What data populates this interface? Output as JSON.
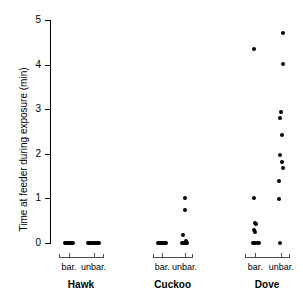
{
  "chart_data": {
    "type": "scatter",
    "title": "",
    "xlabel": "",
    "ylabel": "Time at feeder during exposure (min)",
    "ylim": [
      0,
      5
    ],
    "yticks": [
      0,
      1,
      2,
      3,
      4,
      5
    ],
    "ytick_labels": [
      "0",
      "1",
      "2",
      "3",
      "4",
      "5"
    ],
    "grid": false,
    "legend": "none",
    "groups": [
      "Hawk",
      "Cuckoo",
      "Dove"
    ],
    "subcategories": [
      "bar.",
      "unbar."
    ],
    "series": [
      {
        "name": "Hawk bar.",
        "group": "Hawk",
        "subcategory": "bar.",
        "values": [
          0,
          0,
          0,
          0,
          0,
          0,
          0,
          0,
          0,
          0,
          0,
          0
        ]
      },
      {
        "name": "Hawk unbar.",
        "group": "Hawk",
        "subcategory": "unbar.",
        "values": [
          0,
          0,
          0,
          0,
          0,
          0,
          0,
          0,
          0,
          0,
          0,
          0,
          0,
          0
        ]
      },
      {
        "name": "Cuckoo bar.",
        "group": "Cuckoo",
        "subcategory": "bar.",
        "values": [
          0,
          0,
          0,
          0,
          0,
          0,
          0,
          0,
          0,
          0,
          0,
          0
        ]
      },
      {
        "name": "Cuckoo unbar.",
        "group": "Cuckoo",
        "subcategory": "unbar.",
        "values": [
          1.0,
          0.74,
          0.18,
          0.05,
          0,
          0,
          0,
          0,
          0,
          0,
          0,
          0
        ]
      },
      {
        "name": "Dove bar.",
        "group": "Dove",
        "subcategory": "bar.",
        "values": [
          4.35,
          1.0,
          0.45,
          0.4,
          0.3,
          0.25,
          0.2,
          0,
          0,
          0,
          0,
          0
        ]
      },
      {
        "name": "Dove unbar.",
        "group": "Dove",
        "subcategory": "unbar.",
        "values": [
          4.7,
          4.01,
          2.94,
          2.8,
          2.42,
          1.97,
          1.82,
          1.68,
          1.4,
          0.98,
          0
        ]
      }
    ],
    "points": [
      {
        "x": 0.52,
        "y": 0
      },
      {
        "x": 0.56,
        "y": 0
      },
      {
        "x": 0.6,
        "y": 0
      },
      {
        "x": 0.64,
        "y": 0
      },
      {
        "x": 0.68,
        "y": 0
      },
      {
        "x": 0.72,
        "y": 0
      },
      {
        "x": 0.76,
        "y": 0
      },
      {
        "x": 0.8,
        "y": 0
      },
      {
        "x": 0.84,
        "y": 0
      },
      {
        "x": 1.4,
        "y": 0
      },
      {
        "x": 1.44,
        "y": 0
      },
      {
        "x": 1.48,
        "y": 0
      },
      {
        "x": 1.52,
        "y": 0
      },
      {
        "x": 1.56,
        "y": 0
      },
      {
        "x": 1.6,
        "y": 0
      },
      {
        "x": 1.64,
        "y": 0
      },
      {
        "x": 1.68,
        "y": 0
      },
      {
        "x": 1.72,
        "y": 0
      },
      {
        "x": 1.76,
        "y": 0
      },
      {
        "x": 1.8,
        "y": 0
      },
      {
        "x": 4.02,
        "y": 0
      },
      {
        "x": 4.06,
        "y": 0
      },
      {
        "x": 4.1,
        "y": 0
      },
      {
        "x": 4.14,
        "y": 0
      },
      {
        "x": 4.18,
        "y": 0
      },
      {
        "x": 4.22,
        "y": 0
      },
      {
        "x": 4.26,
        "y": 0
      },
      {
        "x": 4.3,
        "y": 0
      },
      {
        "x": 4.34,
        "y": 0
      },
      {
        "x": 5.02,
        "y": 1.0
      },
      {
        "x": 5.02,
        "y": 0.74
      },
      {
        "x": 4.96,
        "y": 0.18
      },
      {
        "x": 5.06,
        "y": 0.05
      },
      {
        "x": 4.92,
        "y": 0
      },
      {
        "x": 4.96,
        "y": 0
      },
      {
        "x": 5.0,
        "y": 0
      },
      {
        "x": 5.04,
        "y": 0
      },
      {
        "x": 5.08,
        "y": 0
      },
      {
        "x": 5.12,
        "y": 0
      },
      {
        "x": 7.62,
        "y": 4.35
      },
      {
        "x": 7.62,
        "y": 1.0
      },
      {
        "x": 7.66,
        "y": 0.45
      },
      {
        "x": 7.72,
        "y": 0.42
      },
      {
        "x": 7.64,
        "y": 0.3
      },
      {
        "x": 7.68,
        "y": 0.24
      },
      {
        "x": 7.58,
        "y": 0
      },
      {
        "x": 7.62,
        "y": 0
      },
      {
        "x": 7.66,
        "y": 0
      },
      {
        "x": 7.74,
        "y": 0
      },
      {
        "x": 7.82,
        "y": 0
      },
      {
        "x": 8.74,
        "y": 4.7
      },
      {
        "x": 8.74,
        "y": 4.01
      },
      {
        "x": 8.66,
        "y": 2.94
      },
      {
        "x": 8.62,
        "y": 2.8
      },
      {
        "x": 8.7,
        "y": 2.42
      },
      {
        "x": 8.62,
        "y": 1.97
      },
      {
        "x": 8.68,
        "y": 1.82
      },
      {
        "x": 8.72,
        "y": 1.68
      },
      {
        "x": 8.58,
        "y": 1.4
      },
      {
        "x": 8.56,
        "y": 0.98
      },
      {
        "x": 8.62,
        "y": 0
      }
    ],
    "xlim": [
      0,
      9.4
    ]
  },
  "axis": {
    "sub_labels": [
      "bar.",
      "unbar.",
      "bar.",
      "unbar.",
      "bar.",
      "unbar."
    ],
    "group_labels": [
      "Hawk",
      "Cuckoo",
      "Dove"
    ]
  }
}
